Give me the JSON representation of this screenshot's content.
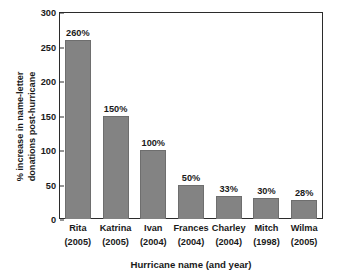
{
  "chart_data": {
    "type": "bar",
    "title": "",
    "subtitle": "",
    "xlabel": "Hurricane name (and year)",
    "ylabel": "% increase in name-letter\ndonations post-hurricane",
    "categories": [
      "Rita",
      "Katrina",
      "Ivan",
      "Frances",
      "Charley",
      "Mitch",
      "Wilma"
    ],
    "category_years": [
      "(2005)",
      "(2005)",
      "(2004)",
      "(2004)",
      "(2004)",
      "(1998)",
      "(2005)"
    ],
    "values": [
      260,
      150,
      100,
      50,
      33,
      30,
      28
    ],
    "data_labels": [
      "260%",
      "150%",
      "100%",
      "50%",
      "33%",
      "30%",
      "28%"
    ],
    "ylim": [
      0,
      300
    ],
    "yticks": [
      0,
      50,
      100,
      150,
      200,
      250,
      300
    ],
    "ytick_labels": [
      "0",
      "50",
      "100",
      "150",
      "200",
      "250",
      "300"
    ],
    "grid": false,
    "legend": null,
    "legend_position": "none",
    "bar_color": "#838383",
    "bar_edge_color": "#6e6e6e",
    "axis_color": "#2b2b2b",
    "background_color": "#ffffff",
    "text_color": "#1a1a1a"
  }
}
